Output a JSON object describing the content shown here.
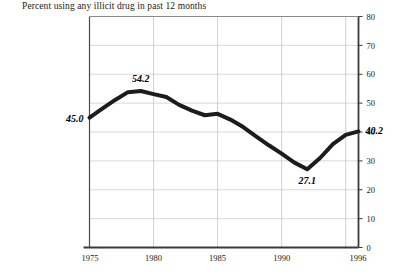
{
  "chart_data": {
    "type": "line",
    "title": "Percent using any illicit drug in past 12 months",
    "xlabel": "",
    "ylabel": "",
    "xlim": [
      1975,
      1996
    ],
    "ylim": [
      0,
      80
    ],
    "grid": true,
    "legend": false,
    "y_ticks": [
      0,
      10,
      20,
      30,
      40,
      50,
      60,
      70,
      80
    ],
    "y_tick_labels": [
      "0",
      "10",
      "20",
      "30",
      "40",
      "50",
      "60",
      "70",
      "80"
    ],
    "y_axis_position": "right",
    "x_ticks": [
      1975,
      1980,
      1985,
      1990,
      1996
    ],
    "x_tick_labels": [
      "1975",
      "1980",
      "1985",
      "1990",
      "1996"
    ],
    "x_gridlines": [
      1980,
      1985,
      1990,
      1995
    ],
    "line_color": "#1c1c1c",
    "line_width": 4,
    "x": [
      1975,
      1976,
      1977,
      1978,
      1979,
      1980,
      1981,
      1982,
      1983,
      1984,
      1985,
      1986,
      1987,
      1988,
      1989,
      1990,
      1991,
      1992,
      1993,
      1994,
      1995,
      1996
    ],
    "values": [
      45.0,
      48.1,
      51.1,
      53.8,
      54.2,
      53.1,
      52.1,
      49.4,
      47.4,
      45.8,
      46.3,
      44.3,
      41.7,
      38.5,
      35.4,
      32.5,
      29.4,
      27.1,
      31.0,
      35.8,
      39.0,
      40.2
    ],
    "annotations": [
      {
        "label": "45.0",
        "x": 1975,
        "y": 45.0,
        "position": "left"
      },
      {
        "label": "54.2",
        "x": 1979,
        "y": 54.2,
        "position": "above"
      },
      {
        "label": "27.1",
        "x": 1992,
        "y": 27.1,
        "position": "below"
      },
      {
        "label": "40.2",
        "x": 1996,
        "y": 40.2,
        "position": "right"
      }
    ]
  },
  "source": {
    "note": ""
  }
}
